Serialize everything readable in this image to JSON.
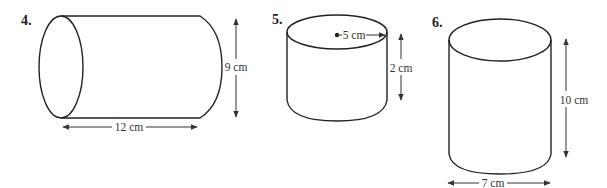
{
  "figures": [
    {
      "number": "4.",
      "shape": "cylinder (horizontal)",
      "dimensions": {
        "height_label": "9 cm",
        "length_label": "12 cm"
      }
    },
    {
      "number": "5.",
      "shape": "cylinder (vertical)",
      "dimensions": {
        "radius_label": "5 cm",
        "height_label": "2 cm"
      }
    },
    {
      "number": "6.",
      "shape": "cylinder (vertical)",
      "dimensions": {
        "height_label": "10 cm",
        "diameter_label": "7 cm"
      }
    }
  ],
  "colors": {
    "stroke": "#222222",
    "background": "#ffffff"
  }
}
